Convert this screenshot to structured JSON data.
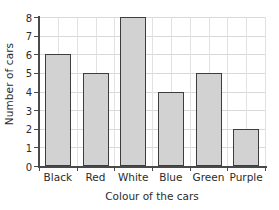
{
  "chart_data": {
    "type": "bar",
    "title": "",
    "categories": [
      "Black",
      "Red",
      "White",
      "Blue",
      "Green",
      "Purple"
    ],
    "values": [
      6,
      5,
      8,
      4,
      5,
      2
    ],
    "xlabel": "Colour of the cars",
    "ylabel": "Number of cars",
    "ylim": [
      0,
      8
    ],
    "ytick_labels": [
      "0",
      "1",
      "2",
      "3",
      "4",
      "5",
      "6",
      "7",
      "8"
    ],
    "ytick_values": [
      0,
      1,
      2,
      3,
      4,
      5,
      6,
      7,
      8
    ],
    "grid": {
      "horizontal": true,
      "vertical": true
    },
    "legend": {
      "visible": false,
      "position": "none"
    },
    "colors": {
      "bar_fill": "#d2d2d2",
      "bar_border": "#3d3d3d",
      "gridline": "#d9d9d9",
      "gridline_vertical": "#e2e2e2",
      "axis": "#4a4a4a",
      "text": "#2b2b2b",
      "background": "#ffffff"
    }
  }
}
